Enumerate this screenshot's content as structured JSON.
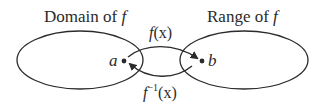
{
  "diagram": {
    "domain_label": {
      "text": "Domain of ",
      "var": "f"
    },
    "range_label": {
      "text": "Range of ",
      "var": "f"
    },
    "forward_map": {
      "func": "f",
      "arg": "(x)"
    },
    "inverse_map": {
      "func": "f",
      "sup": "−1",
      "arg": "(x)"
    },
    "point_a": "a",
    "point_b": "b",
    "colors": {
      "stroke": "#2b2b2b",
      "background": "#ffffff"
    }
  }
}
